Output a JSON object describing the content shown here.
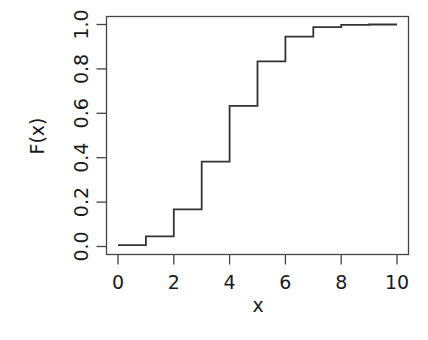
{
  "chart_data": {
    "type": "line",
    "subtype": "step",
    "title": "",
    "xlabel": "x",
    "ylabel": "F(x)",
    "x": [
      0,
      1,
      2,
      3,
      4,
      5,
      6,
      7,
      8,
      9,
      10
    ],
    "values": [
      0.006,
      0.046,
      0.167,
      0.382,
      0.633,
      0.834,
      0.945,
      0.988,
      0.998,
      1.0,
      1.0
    ],
    "xlim": [
      0,
      10
    ],
    "ylim": [
      0.0,
      1.0
    ],
    "xticks": [
      0,
      2,
      4,
      6,
      8,
      10
    ],
    "xtick_labels": [
      "0",
      "2",
      "4",
      "6",
      "8",
      "10"
    ],
    "yticks": [
      0.0,
      0.2,
      0.4,
      0.6,
      0.8,
      1.0
    ],
    "ytick_labels": [
      "0.0",
      "0.2",
      "0.4",
      "0.6",
      "0.8",
      "1.0"
    ],
    "grid": false,
    "legend": null,
    "line_color": "#333333",
    "box": true
  }
}
